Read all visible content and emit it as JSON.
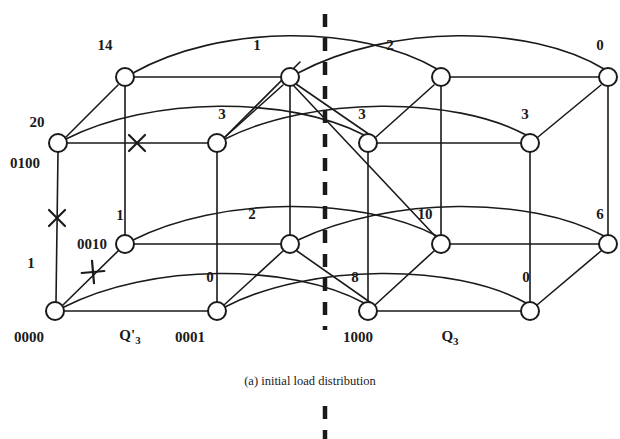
{
  "figure": {
    "caption": "(a) initial load distribution",
    "node_radius": 9,
    "colors": {
      "ink": "#1a1a1a",
      "background": "#ffffff"
    },
    "nodes": [
      {
        "id": "n_top_0",
        "x": 125,
        "y": 77,
        "load": "14",
        "address": ""
      },
      {
        "id": "n_top_1",
        "x": 290,
        "y": 77,
        "load": "1",
        "address": ""
      },
      {
        "id": "n_top_2",
        "x": 441,
        "y": 77,
        "load": "2",
        "address": ""
      },
      {
        "id": "n_top_3",
        "x": 608,
        "y": 77,
        "load": "0",
        "address": ""
      },
      {
        "id": "n_mid_0",
        "x": 58,
        "y": 143,
        "load": "20",
        "address": "0100"
      },
      {
        "id": "n_mid_1",
        "x": 217,
        "y": 143,
        "load": "3",
        "address": ""
      },
      {
        "id": "n_mid_2",
        "x": 368,
        "y": 143,
        "load": "3",
        "address": ""
      },
      {
        "id": "n_mid_3",
        "x": 530,
        "y": 143,
        "load": "3",
        "address": ""
      },
      {
        "id": "n_low_0",
        "x": 125,
        "y": 244,
        "load": "1",
        "address": "0010"
      },
      {
        "id": "n_low_1",
        "x": 290,
        "y": 244,
        "load": "2",
        "address": ""
      },
      {
        "id": "n_low_2",
        "x": 441,
        "y": 244,
        "load": "10",
        "address": ""
      },
      {
        "id": "n_low_3",
        "x": 608,
        "y": 244,
        "load": "6",
        "address": ""
      },
      {
        "id": "n_bot_0",
        "x": 55,
        "y": 311,
        "load": "1",
        "address": "0000"
      },
      {
        "id": "n_bot_1",
        "x": 217,
        "y": 311,
        "load": "0",
        "address": "0001"
      },
      {
        "id": "n_bot_2",
        "x": 368,
        "y": 311,
        "load": "8",
        "address": "1000"
      },
      {
        "id": "n_bot_3",
        "x": 530,
        "y": 311,
        "load": "0",
        "address": ""
      }
    ],
    "load_labels": [
      {
        "text": "14",
        "x": 105,
        "y": 45
      },
      {
        "text": "1",
        "x": 257,
        "y": 45
      },
      {
        "text": "2",
        "x": 390,
        "y": 45
      },
      {
        "text": "0",
        "x": 600,
        "y": 45
      },
      {
        "text": "20",
        "x": 37,
        "y": 122
      },
      {
        "text": "3",
        "x": 222,
        "y": 114
      },
      {
        "text": "3",
        "x": 362,
        "y": 114
      },
      {
        "text": "3",
        "x": 525,
        "y": 114
      },
      {
        "text": "1",
        "x": 31,
        "y": 263
      },
      {
        "text": "1",
        "x": 120,
        "y": 215
      },
      {
        "text": "2",
        "x": 252,
        "y": 214
      },
      {
        "text": "10",
        "x": 425,
        "y": 214
      },
      {
        "text": "6",
        "x": 600,
        "y": 214
      },
      {
        "text": "0",
        "x": 210,
        "y": 277
      },
      {
        "text": "8",
        "x": 355,
        "y": 277
      },
      {
        "text": "0",
        "x": 526,
        "y": 277
      }
    ],
    "address_labels": [
      {
        "text": "0100",
        "x": 25,
        "y": 163
      },
      {
        "text": "0010",
        "x": 92,
        "y": 244
      },
      {
        "text": "0000",
        "x": 29,
        "y": 337
      },
      {
        "text": "0001",
        "x": 190,
        "y": 337
      },
      {
        "text": "1000",
        "x": 358,
        "y": 337
      }
    ],
    "cube_labels": [
      {
        "name": "Q3_prime",
        "base": "Q'",
        "sub": "3",
        "x": 130,
        "y": 336
      },
      {
        "name": "Q3",
        "base": "Q",
        "sub": "3",
        "x": 450,
        "y": 337
      }
    ],
    "divider": {
      "x": 325,
      "y_top": 14,
      "y_bottom": 330
    },
    "lower_divider": {
      "x": 325,
      "y_top": 404,
      "y_bottom": 439
    },
    "cut_marks": [
      {
        "name": "cut-mid-top-left",
        "x": 137,
        "y": 143,
        "angle": 0
      },
      {
        "name": "cut-vertical-left",
        "x": 57,
        "y": 218,
        "angle": 0
      },
      {
        "name": "cut-diagonal-low",
        "x": 93,
        "y": 272,
        "angle": 40
      }
    ]
  }
}
